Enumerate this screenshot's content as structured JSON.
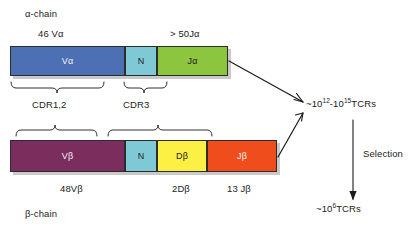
{
  "alpha_chain": {
    "chain_label": "α-chain",
    "v_count_label": "46 Vα",
    "j_count_label": "> 50Jα",
    "segments": [
      {
        "name": "Vα",
        "label": "Vα",
        "color": "#4d6fb3",
        "x": 10,
        "width": 115
      },
      {
        "name": "N",
        "label": "N",
        "color": "#7fc9d6",
        "x": 125,
        "width": 32
      },
      {
        "name": "Jα",
        "label": "Jα",
        "color": "#8cc63f",
        "x": 157,
        "width": 71
      }
    ]
  },
  "beta_chain": {
    "chain_label": "β-chain",
    "v_count_label": "48Vβ",
    "d_count_label": "2Dβ",
    "j_count_label": "13 Jβ",
    "segments": [
      {
        "name": "Vβ",
        "label": "Vβ",
        "color": "#7b2d5e",
        "x": 10,
        "width": 115
      },
      {
        "name": "N",
        "label": "N",
        "color": "#7fc9d6",
        "x": 125,
        "width": 32
      },
      {
        "name": "Dβ",
        "label": "Dβ",
        "color": "#fdf045",
        "x": 157,
        "width": 50
      },
      {
        "name": "Jβ",
        "label": "Jβ",
        "color": "#f04d1c",
        "x": 207,
        "width": 70
      }
    ]
  },
  "cdr_labels": {
    "cdr12": "CDR1,2",
    "cdr3": "CDR3"
  },
  "outputs": {
    "diversity_prefix": "~10",
    "diversity_exp_low": "12",
    "diversity_mid": "-10",
    "diversity_exp_high": "15",
    "diversity_suffix": "TCRs",
    "selection_label": "Selection",
    "selected_prefix": "~10",
    "selected_exp": "6",
    "selected_suffix": "TCRs"
  },
  "colors": {
    "v_alpha": "#4d6fb3",
    "n_region": "#7fc9d6",
    "j_alpha": "#8cc63f",
    "v_beta": "#7b2d5e",
    "d_beta": "#fdf045",
    "j_beta": "#f04d1c",
    "outline": "#2b2b2b",
    "text": "#1b1b1b"
  }
}
